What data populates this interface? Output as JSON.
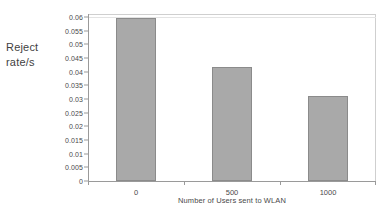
{
  "chart_data": {
    "type": "bar",
    "title": "",
    "subtitle": "",
    "xlabel": "Number of Users sent to WLAN",
    "ylabel": "Reject rate/s",
    "ylabel_line1": "Reject",
    "ylabel_line2": "rate/s",
    "categories": [
      "0",
      "500",
      "1000"
    ],
    "values": [
      0.0595,
      0.0417,
      0.0311
    ],
    "series": [
      {
        "name": "Reject rate/s",
        "values": [
          0.0595,
          0.0417,
          0.0311
        ]
      }
    ],
    "ylim": [
      0,
      0.06
    ],
    "xlim_categories": 3,
    "ytick_labels": [
      "0.06",
      "0.055",
      "0.05",
      "0.045",
      "0.04",
      "0.035",
      "0.03",
      "0.025",
      "0.02",
      "0.015",
      "0.01",
      "0.005",
      "0"
    ],
    "ytick_values": [
      0.06,
      0.055,
      0.05,
      0.045,
      0.04,
      0.035,
      0.03,
      0.025,
      0.02,
      0.015,
      0.01,
      0.005,
      0
    ],
    "xtick_labels": [
      "0",
      "500",
      "1000"
    ],
    "grid": false,
    "legend": false,
    "legend_position": "none",
    "bar_color": "#a9a9a9",
    "bar_edge_color": "#8b8b8b",
    "axis_color": "#9a9a9a",
    "frame_color": "#cfcfcf",
    "text_color": "#4a4a4a",
    "background": "#ffffff"
  }
}
